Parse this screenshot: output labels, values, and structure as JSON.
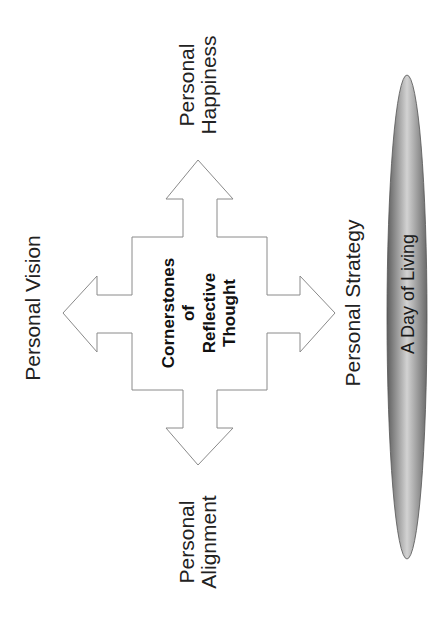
{
  "diagram": {
    "center": {
      "lines": [
        "Cornerstones",
        "of",
        "Reflective",
        "Thought"
      ]
    },
    "labels": {
      "top": [
        "Personal",
        "Happiness"
      ],
      "left": [
        "Personal Vision"
      ],
      "right": [
        "Personal Strategy"
      ],
      "bottom": [
        "Personal",
        "Alignment"
      ]
    },
    "ellipse": {
      "label": "A Day of Living"
    }
  },
  "colors": {
    "arrow_stroke": "#8a8a8a",
    "arrow_fill": "#ffffff",
    "ellipse_dark": "#6e6e6e",
    "ellipse_light": "#cfcfcf",
    "ellipse_stroke": "#555555",
    "text": "#222222"
  }
}
